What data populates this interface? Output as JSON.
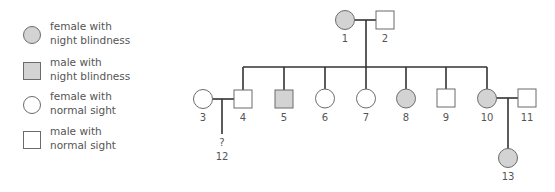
{
  "legend": {
    "items": [
      {
        "symbol": "circle",
        "affected": true,
        "line1": "female with",
        "line2": "night blindness"
      },
      {
        "symbol": "square",
        "affected": true,
        "line1": "male with",
        "line2": "night blindness"
      },
      {
        "symbol": "circle",
        "affected": false,
        "line1": "female with",
        "line2": "normal sight"
      },
      {
        "symbol": "square",
        "affected": false,
        "line1": "male with",
        "line2": "normal sight"
      }
    ]
  },
  "colors": {
    "affected_fill": "#d3d3d3",
    "unaffected_fill": "#ffffff",
    "outline": "#6b6b6b",
    "line": "#333333",
    "text": "#555555"
  },
  "pedigree": {
    "individuals": [
      {
        "id": "1",
        "sex": "female",
        "affected": true
      },
      {
        "id": "2",
        "sex": "male",
        "affected": false
      },
      {
        "id": "3",
        "sex": "female",
        "affected": false
      },
      {
        "id": "4",
        "sex": "male",
        "affected": false
      },
      {
        "id": "5",
        "sex": "male",
        "affected": true
      },
      {
        "id": "6",
        "sex": "female",
        "affected": false
      },
      {
        "id": "7",
        "sex": "female",
        "affected": false
      },
      {
        "id": "8",
        "sex": "female",
        "affected": true
      },
      {
        "id": "9",
        "sex": "male",
        "affected": false
      },
      {
        "id": "10",
        "sex": "female",
        "affected": true
      },
      {
        "id": "11",
        "sex": "male",
        "affected": false
      },
      {
        "id": "12",
        "sex": "unknown",
        "affected": null,
        "marker": "?"
      },
      {
        "id": "13",
        "sex": "female",
        "affected": true
      }
    ],
    "couples": [
      [
        "1",
        "2"
      ],
      [
        "3",
        "4"
      ],
      [
        "10",
        "11"
      ]
    ],
    "children": {
      "1+2": [
        "4",
        "5",
        "6",
        "7",
        "8",
        "9",
        "10"
      ],
      "3+4": [
        "12"
      ],
      "10+11": [
        "13"
      ]
    },
    "labels": {
      "i1": "1",
      "i2": "2",
      "i3": "3",
      "i4": "4",
      "i5": "5",
      "i6": "6",
      "i7": "7",
      "i8": "8",
      "i9": "9",
      "i10": "10",
      "i11": "11",
      "i12": "12",
      "i12_marker": "?",
      "i13": "13"
    }
  }
}
